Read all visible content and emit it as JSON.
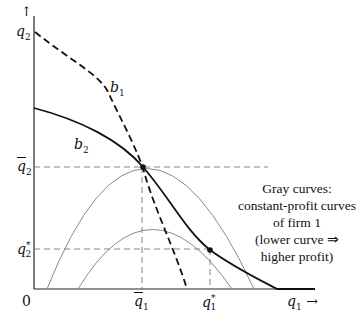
{
  "diagram": {
    "axes": {
      "y_label": "q2",
      "y_arrow": "↑",
      "x_label": "q1",
      "x_arrow": "→",
      "origin": "0"
    },
    "ticks": {
      "y": [
        {
          "label": "q̄2",
          "name": "q2-bar"
        },
        {
          "label": "q2*",
          "name": "q2-star"
        }
      ],
      "x": [
        {
          "label": "q̄1",
          "name": "q1-bar"
        },
        {
          "label": "q1*",
          "name": "q1-star"
        }
      ]
    },
    "curves": {
      "b1": {
        "label": "b1",
        "style": "dashed",
        "color": "#111111"
      },
      "b2": {
        "label": "b2",
        "style": "solid",
        "color": "#111111"
      },
      "isoprofit": {
        "color": "#8a8a8a",
        "count": 2
      }
    },
    "annotation": {
      "line1": "Gray curves:",
      "line2": "constant-profit curves",
      "line3": "of firm 1",
      "line4": "(lower curve ⇒",
      "line5": "higher profit)"
    }
  }
}
